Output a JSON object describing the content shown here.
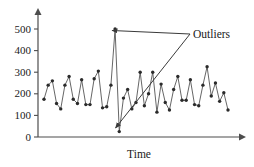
{
  "chart_data": {
    "type": "line",
    "title": "",
    "subtitle": "",
    "xlabel": "Time",
    "ylabel": "",
    "xlim": [
      0,
      46
    ],
    "ylim": [
      0,
      560
    ],
    "grid": false,
    "legend": "none",
    "y_ticks": [
      0,
      100,
      200,
      300,
      400,
      500
    ],
    "y_tick_labels": [
      "0",
      "100",
      "200",
      "300",
      "400",
      "500"
    ],
    "x_ticks": [],
    "x_tick_labels": [],
    "markers": "filled-circle",
    "series": [
      {
        "name": "observed-series",
        "x": [
          1,
          2,
          3,
          4,
          5,
          6,
          7,
          8,
          9,
          10,
          11,
          12,
          13,
          14,
          15,
          16,
          17,
          18,
          19,
          20,
          21,
          22,
          23,
          24,
          25,
          26,
          27,
          28,
          29,
          30,
          31,
          32,
          33,
          34,
          35,
          36,
          37,
          38,
          39,
          40,
          41,
          42,
          43,
          44,
          45
        ],
        "values": [
          175,
          240,
          260,
          155,
          130,
          240,
          280,
          175,
          155,
          265,
          150,
          150,
          270,
          305,
          135,
          140,
          240,
          500,
          25,
          180,
          220,
          130,
          160,
          300,
          145,
          200,
          300,
          115,
          245,
          160,
          125,
          220,
          280,
          170,
          170,
          265,
          150,
          145,
          240,
          325,
          190,
          250,
          165,
          205,
          125
        ],
        "color": "#555555"
      }
    ],
    "annotations": [
      {
        "name": "outliers-label",
        "text": "Outliers",
        "points_to": [
          {
            "label": "high-outlier",
            "x": 18,
            "y": 500
          },
          {
            "label": "low-outlier",
            "x": 19,
            "y": 25
          }
        ]
      }
    ]
  },
  "axes": {
    "y_axis_name": "value-axis",
    "x_axis_name": "time-axis",
    "x_axis_title": "Time",
    "arrowheads": "both"
  },
  "colors": {
    "line": "#555555",
    "marker": "#2b2b2b",
    "axis": "#4d4d4d",
    "text": "#1a1a1a",
    "background": "#ffffff",
    "annotation": "#3a3a3a"
  }
}
